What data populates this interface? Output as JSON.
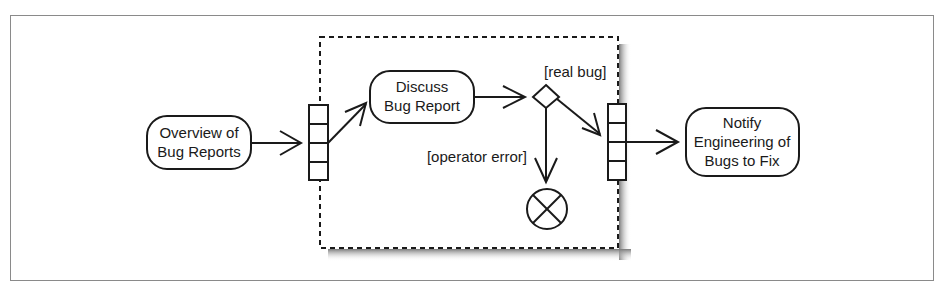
{
  "diagram": {
    "type": "UML activity diagram",
    "nodes": {
      "overview": {
        "line1": "Overview of",
        "line2": "Bug Reports"
      },
      "discuss": {
        "line1": "Discuss",
        "line2": "Bug Report"
      },
      "notify": {
        "line1": "Notify",
        "line2": "Engineering of",
        "line3": "Bugs to Fix"
      }
    },
    "guards": {
      "real_bug": "[real bug]",
      "operator_error": "[operator error]"
    },
    "colors": {
      "stroke": "#1a1a1a",
      "frame": "#8a8a8a",
      "shadow": "#9a9a9a",
      "background": "#ffffff"
    }
  }
}
